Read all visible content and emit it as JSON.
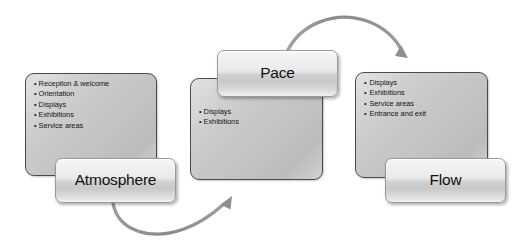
{
  "diagram": {
    "accent_color": "#8c8c8c",
    "panel_fill": "#c6c6c6",
    "panel_border": "#4a4a4a",
    "button_fill": "#e8e8e8",
    "text_color": "#141414"
  },
  "stages": [
    {
      "key": "atmosphere",
      "label": "Atmosphere",
      "items": [
        "Reception & welcome",
        "Orientation",
        "Displays",
        "Exhibitions",
        "Service areas"
      ]
    },
    {
      "key": "pace",
      "label": "Pace",
      "items": [
        "Displays",
        "Exhibitions"
      ]
    },
    {
      "key": "flow",
      "label": "Flow",
      "items": [
        "Displays",
        "Exhibitions",
        "Service areas",
        "Entrance and exit"
      ]
    }
  ],
  "connectors": [
    {
      "key": "atmosphere-to-pace",
      "from": "atmosphere",
      "to": "pace",
      "direction": "curve-down-right",
      "color": "#8c8c8c"
    },
    {
      "key": "pace-to-flow",
      "from": "pace",
      "to": "flow",
      "direction": "curve-up-right",
      "color": "#8c8c8c"
    }
  ]
}
